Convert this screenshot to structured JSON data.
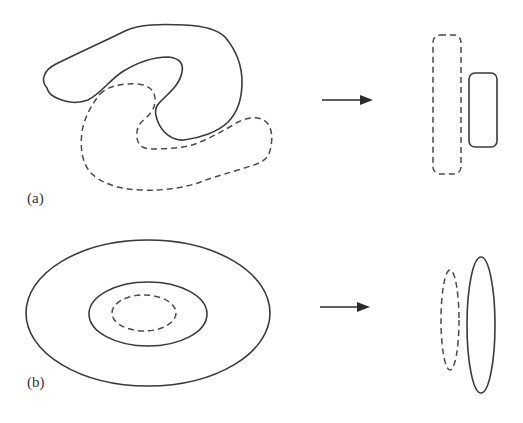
{
  "figure": {
    "colors": {
      "stroke": "#3a3a3a",
      "dashed_stroke": "#4a4a4a",
      "background": "#ffffff"
    },
    "panels": [
      {
        "id": "a",
        "label": "(a)",
        "left_shapes": [
          {
            "name": "solid-s-shape",
            "style": "solid",
            "type": "freeform-curve"
          },
          {
            "name": "dashed-s-shape",
            "style": "dashed",
            "type": "freeform-curve"
          }
        ],
        "arrow": {
          "direction": "right",
          "from": [
            322,
            100
          ],
          "to": [
            373,
            100
          ]
        },
        "right_shapes": [
          {
            "name": "dashed-rounded-rect",
            "style": "dashed",
            "type": "rounded-rectangle",
            "x": 433,
            "y": 35,
            "w": 28,
            "h": 139
          },
          {
            "name": "solid-rounded-rect",
            "style": "solid",
            "type": "rounded-rectangle",
            "x": 469,
            "y": 73,
            "w": 28,
            "h": 74
          }
        ]
      },
      {
        "id": "b",
        "label": "(b)",
        "left_shapes": [
          {
            "name": "outer-ellipse",
            "style": "solid",
            "type": "ellipse",
            "cx": 148,
            "cy": 313,
            "rx": 122,
            "ry": 73
          },
          {
            "name": "middle-ellipse",
            "style": "solid",
            "type": "ellipse",
            "cx": 148,
            "cy": 314,
            "rx": 59,
            "ry": 32
          },
          {
            "name": "inner-dashed-ellipse",
            "style": "dashed",
            "type": "ellipse",
            "cx": 144,
            "cy": 313,
            "rx": 32,
            "ry": 18
          }
        ],
        "arrow": {
          "direction": "right",
          "from": [
            320,
            307
          ],
          "to": [
            370,
            307
          ]
        },
        "right_shapes": [
          {
            "name": "dashed-vertical-ellipse",
            "style": "dashed",
            "type": "ellipse",
            "cx": 450,
            "cy": 320,
            "rx": 9,
            "ry": 50
          },
          {
            "name": "solid-vertical-ellipse",
            "style": "solid",
            "type": "ellipse",
            "cx": 481,
            "cy": 325,
            "rx": 14,
            "ry": 68
          }
        ]
      }
    ]
  }
}
